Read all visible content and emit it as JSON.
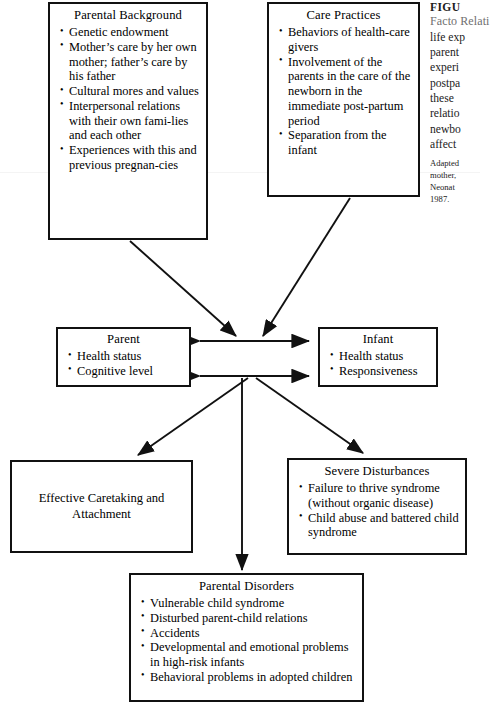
{
  "figure": {
    "background_color": "#ffffff",
    "line_color": "#111111",
    "caption_title_color": "#6f6f6f"
  },
  "nodes": {
    "parental_background": {
      "title": "Parental Background",
      "items": [
        "Genetic endowment",
        "Mother’s care by her own mother; father’s care by his father",
        "Cultural mores and values",
        "Interpersonal relations with their own fami-lies and each other",
        "Experiences with this and previous pregnan-cies"
      ]
    },
    "care_practices": {
      "title": "Care Practices",
      "items": [
        "Behaviors of health-care givers",
        "Involvement of the parents in the care of the newborn in the immediate post-partum period",
        "Separation from the infant"
      ]
    },
    "parent": {
      "title": "Parent",
      "items": [
        "Health status",
        "Cognitive level"
      ]
    },
    "infant": {
      "title": "Infant",
      "items": [
        "Health status",
        "Responsiveness"
      ]
    },
    "effective_caretaking": {
      "title": "Effective Caretaking and Attachment"
    },
    "severe_disturbances": {
      "title": "Severe Disturbances",
      "items": [
        "Failure to thrive syndrome (without organic disease)",
        "Child abuse and battered child syndrome"
      ]
    },
    "parental_disorders": {
      "title": "Parental Disorders",
      "items": [
        "Vulnerable child syndrome",
        "Disturbed parent-child relations",
        "Accidents",
        "Developmental and emotional problems in high-risk infants",
        "Behavioral problems in adopted children"
      ]
    }
  },
  "caption": {
    "figure_label": "FIGU",
    "title": "Facto\nRelati",
    "body": "life exp\nparent\nexperi\npostpa\nthese \nrelatio\nnewbo\naffect ",
    "source": "Adapted\nmother,\nNeonat\n1987."
  }
}
